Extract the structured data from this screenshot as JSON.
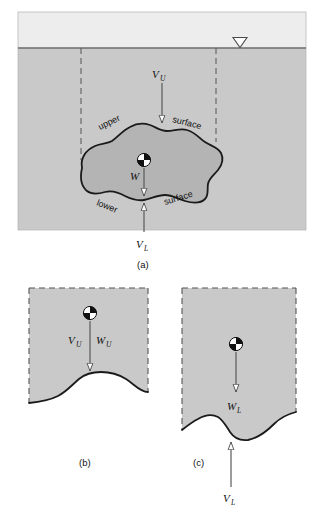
{
  "figure": {
    "title_text": "",
    "colors": {
      "air_fill": "#ededed",
      "soil_fill": "#c9c9c9",
      "body_fill": "#b4b4b4",
      "page_bg": "#ffffff",
      "line": "#1a1a1a",
      "dashed_line": "#555555",
      "arrow_line": "#5a5a5a",
      "arrow_head_fill": "#ffffff",
      "text": "#111111"
    },
    "panels": [
      {
        "id": "a",
        "caption": "(a)",
        "labels": {
          "upper_prefix": "upper",
          "upper_suffix": "surface",
          "lower_prefix": "lower",
          "lower_suffix": "surface"
        },
        "forces": [
          {
            "name": "V_U",
            "symbol": "V",
            "subscript": "U",
            "direction": "down"
          },
          {
            "name": "W",
            "symbol": "W",
            "subscript": "",
            "direction": "down"
          },
          {
            "name": "V_L",
            "symbol": "V",
            "subscript": "L",
            "direction": "up"
          }
        ],
        "markers": [
          {
            "name": "water-table-symbol",
            "glyph": "triangle-down-hollow"
          },
          {
            "name": "center-of-gravity-symbol",
            "glyph": "quartered-circle"
          }
        ]
      },
      {
        "id": "b",
        "caption": "(b)",
        "forces": [
          {
            "name": "V_U",
            "symbol": "V",
            "subscript": "U",
            "direction": "down"
          },
          {
            "name": "W_U",
            "symbol": "W",
            "subscript": "U",
            "direction": "down"
          }
        ],
        "markers": [
          {
            "name": "center-of-gravity-symbol",
            "glyph": "quartered-circle"
          }
        ]
      },
      {
        "id": "c",
        "caption": "(c)",
        "forces": [
          {
            "name": "W_L",
            "symbol": "W",
            "subscript": "L",
            "direction": "down"
          },
          {
            "name": "V_L",
            "symbol": "V",
            "subscript": "L",
            "direction": "up"
          }
        ],
        "markers": [
          {
            "name": "center-of-gravity-symbol",
            "glyph": "quartered-circle"
          }
        ]
      }
    ],
    "text": {
      "vu": "V",
      "vu_sub": "U",
      "vl": "V",
      "vl_sub": "L",
      "w": "W",
      "wu": "W",
      "wu_sub": "U",
      "wl": "W",
      "wl_sub": "L",
      "upper": "upper",
      "surface_upper": "surface",
      "lower": "lower",
      "surface_lower": "surface",
      "cap_a": "(a)",
      "cap_b": "(b)",
      "cap_c": "(c)"
    }
  }
}
